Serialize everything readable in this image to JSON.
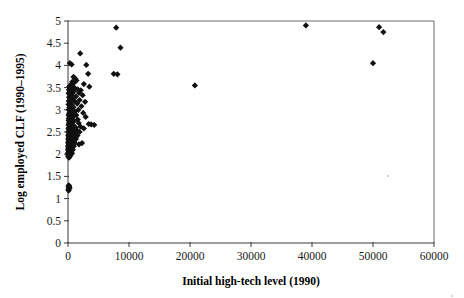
{
  "chart_data": {
    "type": "scatter",
    "title": "",
    "xlabel": "Initial high-tech level (1990)",
    "ylabel": "Log employed CLF (1990–1995)",
    "xlim": [
      0,
      60000
    ],
    "ylim": [
      0,
      5
    ],
    "xticks": [
      0,
      10000,
      20000,
      30000,
      40000,
      50000,
      60000
    ],
    "xtick_labels": [
      "0",
      "10000",
      "20000",
      "30000",
      "40000",
      "50000",
      "60000"
    ],
    "yticks": [
      0,
      0.5,
      1,
      1.5,
      2,
      2.5,
      3,
      3.5,
      4,
      4.5,
      5
    ],
    "ytick_labels": [
      "0",
      "0.5",
      "1",
      "1.5",
      "2",
      "2.5",
      "3",
      "3.5",
      "4",
      "4.5",
      "5"
    ],
    "grid": false,
    "legend": null,
    "marker": "diamond",
    "marker_color": "#111111",
    "series": [
      {
        "name": "Metropolitan areas",
        "points": [
          [
            7900,
            4.85
          ],
          [
            39000,
            4.9
          ],
          [
            51000,
            4.86
          ],
          [
            51700,
            4.75
          ],
          [
            8600,
            4.4
          ],
          [
            2000,
            4.27
          ],
          [
            50000,
            4.05
          ],
          [
            300,
            4.05
          ],
          [
            600,
            4.02
          ],
          [
            3000,
            4.01
          ],
          [
            7500,
            3.81
          ],
          [
            8100,
            3.8
          ],
          [
            3300,
            3.81
          ],
          [
            900,
            3.74
          ],
          [
            1200,
            3.7
          ],
          [
            1400,
            3.66
          ],
          [
            700,
            3.63
          ],
          [
            1000,
            3.61
          ],
          [
            2600,
            3.58
          ],
          [
            20800,
            3.55
          ],
          [
            3500,
            3.52
          ],
          [
            500,
            3.57
          ],
          [
            400,
            3.55
          ],
          [
            800,
            3.52
          ],
          [
            1100,
            3.49
          ],
          [
            200,
            3.52
          ],
          [
            1600,
            3.46
          ],
          [
            2100,
            3.44
          ],
          [
            350,
            3.47
          ],
          [
            650,
            3.45
          ],
          [
            950,
            3.42
          ],
          [
            150,
            3.45
          ],
          [
            1800,
            3.38
          ],
          [
            2400,
            3.33
          ],
          [
            450,
            3.4
          ],
          [
            750,
            3.37
          ],
          [
            250,
            3.4
          ],
          [
            1300,
            3.3
          ],
          [
            550,
            3.33
          ],
          [
            100,
            3.37
          ],
          [
            1900,
            3.22
          ],
          [
            2800,
            3.18
          ],
          [
            300,
            3.29
          ],
          [
            700,
            3.25
          ],
          [
            1050,
            3.2
          ],
          [
            180,
            3.28
          ],
          [
            420,
            3.24
          ],
          [
            1500,
            3.14
          ],
          [
            260,
            3.18
          ],
          [
            620,
            3.12
          ],
          [
            130,
            3.2
          ],
          [
            2200,
            3.08
          ],
          [
            900,
            3.06
          ],
          [
            340,
            3.1
          ],
          [
            80,
            3.12
          ],
          [
            1700,
            3.0
          ],
          [
            520,
            3.02
          ],
          [
            210,
            3.05
          ],
          [
            1150,
            2.96
          ],
          [
            660,
            2.94
          ],
          [
            2500,
            2.93
          ],
          [
            310,
            2.98
          ],
          [
            120,
            3.0
          ],
          [
            1350,
            2.88
          ],
          [
            480,
            2.9
          ],
          [
            190,
            2.92
          ],
          [
            850,
            2.85
          ],
          [
            2900,
            2.84
          ],
          [
            270,
            2.86
          ],
          [
            95,
            2.88
          ],
          [
            1600,
            2.78
          ],
          [
            560,
            2.8
          ],
          [
            230,
            2.82
          ],
          [
            1000,
            2.75
          ],
          [
            390,
            2.77
          ],
          [
            140,
            2.8
          ],
          [
            3400,
            2.68
          ],
          [
            3800,
            2.67
          ],
          [
            4300,
            2.66
          ],
          [
            1750,
            2.7
          ],
          [
            700,
            2.72
          ],
          [
            290,
            2.74
          ],
          [
            110,
            2.76
          ],
          [
            2050,
            2.62
          ],
          [
            880,
            2.65
          ],
          [
            440,
            2.67
          ],
          [
            170,
            2.7
          ],
          [
            2600,
            2.58
          ],
          [
            1250,
            2.6
          ],
          [
            600,
            2.62
          ],
          [
            250,
            2.64
          ],
          [
            90,
            2.66
          ],
          [
            1450,
            2.54
          ],
          [
            760,
            2.56
          ],
          [
            360,
            2.58
          ],
          [
            150,
            2.6
          ],
          [
            1900,
            2.5
          ],
          [
            980,
            2.52
          ],
          [
            500,
            2.54
          ],
          [
            210,
            2.56
          ],
          [
            75,
            2.58
          ],
          [
            1150,
            2.46
          ],
          [
            640,
            2.48
          ],
          [
            300,
            2.5
          ],
          [
            120,
            2.52
          ],
          [
            1550,
            2.42
          ],
          [
            820,
            2.44
          ],
          [
            410,
            2.46
          ],
          [
            175,
            2.48
          ],
          [
            65,
            2.5
          ],
          [
            1000,
            2.38
          ],
          [
            540,
            2.4
          ],
          [
            260,
            2.42
          ],
          [
            105,
            2.44
          ],
          [
            1300,
            2.34
          ],
          [
            700,
            2.36
          ],
          [
            340,
            2.38
          ],
          [
            145,
            2.4
          ],
          [
            58,
            2.42
          ],
          [
            880,
            2.3
          ],
          [
            450,
            2.32
          ],
          [
            200,
            2.34
          ],
          [
            85,
            2.36
          ],
          [
            1100,
            2.26
          ],
          [
            580,
            2.28
          ],
          [
            280,
            2.3
          ],
          [
            125,
            2.32
          ],
          [
            50,
            2.34
          ],
          [
            760,
            2.22
          ],
          [
            380,
            2.24
          ],
          [
            165,
            2.26
          ],
          [
            70,
            2.28
          ],
          [
            950,
            2.18
          ],
          [
            490,
            2.2
          ],
          [
            230,
            2.22
          ],
          [
            100,
            2.24
          ],
          [
            45,
            2.26
          ],
          [
            620,
            2.14
          ],
          [
            310,
            2.16
          ],
          [
            140,
            2.18
          ],
          [
            60,
            2.2
          ],
          [
            800,
            2.1
          ],
          [
            400,
            2.12
          ],
          [
            190,
            2.14
          ],
          [
            80,
            2.16
          ],
          [
            38,
            2.18
          ],
          [
            520,
            2.06
          ],
          [
            250,
            2.08
          ],
          [
            110,
            2.1
          ],
          [
            48,
            2.12
          ],
          [
            660,
            2.02
          ],
          [
            330,
            2.04
          ],
          [
            150,
            2.06
          ],
          [
            65,
            2.08
          ],
          [
            30,
            2.1
          ],
          [
            420,
            1.98
          ],
          [
            210,
            2.0
          ],
          [
            95,
            2.02
          ],
          [
            40,
            2.04
          ],
          [
            270,
            1.95
          ],
          [
            130,
            1.97
          ],
          [
            55,
            1.99
          ],
          [
            25,
            2.01
          ],
          [
            1800,
            2.22
          ],
          [
            2300,
            2.25
          ],
          [
            180,
            1.92
          ],
          [
            75,
            1.94
          ],
          [
            35,
            1.96
          ],
          [
            120,
            1.3
          ],
          [
            200,
            1.28
          ],
          [
            90,
            1.26
          ],
          [
            260,
            1.24
          ],
          [
            150,
            1.22
          ],
          [
            60,
            1.2
          ],
          [
            110,
            1.18
          ]
        ]
      }
    ]
  }
}
